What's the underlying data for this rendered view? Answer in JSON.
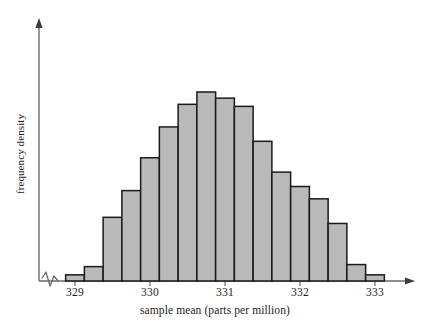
{
  "chart_data": {
    "type": "bar",
    "title": "",
    "subtitle": "",
    "xlabel": "sample mean (parts per million)",
    "ylabel": "frequency density",
    "xtick_labels": [
      "329",
      "330",
      "331",
      "332",
      "333"
    ],
    "xtick_values": [
      329,
      330,
      331,
      332,
      333
    ],
    "xlim": [
      328.875,
      333.125
    ],
    "ylim": [
      0,
      1.0
    ],
    "grid": false,
    "legend": null,
    "axis_break": true,
    "bin_width": 0.25,
    "bin_edges": [
      328.875,
      329.125,
      329.375,
      329.625,
      329.875,
      330.125,
      330.375,
      330.625,
      330.875,
      331.125,
      331.375,
      331.625,
      331.875,
      332.125,
      332.375,
      332.625,
      332.875,
      333.125
    ],
    "bin_centers": [
      329.0,
      329.25,
      329.5,
      329.75,
      330.0,
      330.25,
      330.5,
      330.75,
      331.0,
      331.25,
      331.5,
      331.75,
      332.0,
      332.25,
      332.5,
      332.75,
      333.0
    ],
    "categories": [
      "329.00",
      "329.25",
      "329.50",
      "329.75",
      "330.00",
      "330.25",
      "330.50",
      "330.75",
      "331.00",
      "331.25",
      "331.50",
      "331.75",
      "332.00",
      "332.25",
      "332.50",
      "332.75",
      "333.00"
    ],
    "values": [
      0.03,
      0.07,
      0.31,
      0.44,
      0.6,
      0.75,
      0.86,
      0.92,
      0.89,
      0.85,
      0.68,
      0.53,
      0.46,
      0.4,
      0.28,
      0.08,
      0.03
    ],
    "bar_fill_color": "#b9b9b9",
    "bar_edge_color": "#1a1a1a",
    "axis_color": "#5a5a5a"
  }
}
